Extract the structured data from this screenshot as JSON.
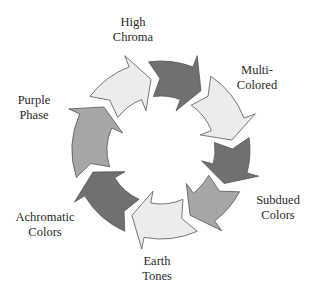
{
  "diagram": {
    "type": "cycle",
    "center": [
      161,
      150
    ],
    "outer_radius": 89,
    "inner_radius": 54,
    "colors": {
      "dark": "#707070",
      "medium": "#a6a6a6",
      "light": "#ececec",
      "outline": "#555555"
    },
    "segments": [
      {
        "name": "arrow-top-left",
        "start": 307,
        "end": 352,
        "shade": "light"
      },
      {
        "name": "arrow-top",
        "start": 352,
        "end": 34,
        "shade": "dark"
      },
      {
        "name": "arrow-top-right",
        "start": 34,
        "end": 82,
        "shade": "light"
      },
      {
        "name": "arrow-right",
        "start": 82,
        "end": 118,
        "shade": "dark"
      },
      {
        "name": "arrow-bottom-right",
        "start": 118,
        "end": 156,
        "shade": "medium"
      },
      {
        "name": "arrow-bottom",
        "start": 156,
        "end": 204,
        "shade": "light"
      },
      {
        "name": "arrow-bottom-left",
        "start": 204,
        "end": 252,
        "shade": "dark"
      },
      {
        "name": "arrow-left",
        "start": 252,
        "end": 307,
        "shade": "medium"
      }
    ]
  },
  "labels": {
    "high_chroma": {
      "line1": "High",
      "line2": "Chroma"
    },
    "multi_colored": {
      "line1": "Multi-",
      "line2": "Colored"
    },
    "subdued_colors": {
      "line1": "Subdued",
      "line2": "Colors"
    },
    "earth_tones": {
      "line1": "Earth",
      "line2": "Tones"
    },
    "achromatic_colors": {
      "line1": "Achromatic",
      "line2": "Colors"
    },
    "purple_phase": {
      "line1": "Purple",
      "line2": "Phase"
    }
  }
}
